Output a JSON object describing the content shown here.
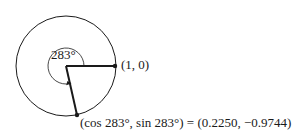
{
  "diagram": {
    "angle_label": "283°",
    "initial_point_label": "(1, 0)",
    "terminal_point_label": "(cos 283°, sin 283°) = (0.2250, −0.9744)",
    "geometry": {
      "center": [
        66,
        66
      ],
      "radius": 50,
      "angle_degrees": 283,
      "initial_point": [
        116,
        66
      ],
      "terminal_point": [
        77,
        115
      ]
    },
    "colors": {
      "stroke": "#1a1a1a",
      "background": "#ffffff"
    }
  }
}
